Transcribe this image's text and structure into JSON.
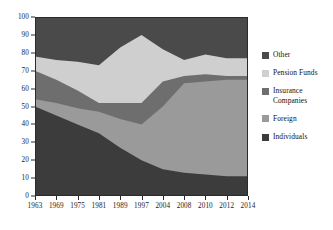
{
  "chart_data": {
    "type": "area",
    "stacked": true,
    "title": "",
    "xlabel": "",
    "ylabel": "",
    "x": [
      1963,
      1969,
      1975,
      1981,
      1989,
      1997,
      2004,
      2008,
      2010,
      2012,
      2014
    ],
    "categories": [
      "1963",
      "1969",
      "1975",
      "1981",
      "1989",
      "1997",
      "2004",
      "2008",
      "2010",
      "2012",
      "2014"
    ],
    "xtick_labels": [
      "1963",
      "1969",
      "1975",
      "1981",
      "1989",
      "1997",
      "2004",
      "2008",
      "2010",
      "2012",
      "2014"
    ],
    "ylim": [
      0,
      100
    ],
    "ytick_labels": [
      "0",
      "10",
      "20",
      "30",
      "40",
      "50",
      "60",
      "70",
      "80",
      "90",
      "100"
    ],
    "yticks": [
      0,
      10,
      20,
      30,
      40,
      50,
      60,
      70,
      80,
      90,
      100
    ],
    "grid": false,
    "legend_position": "right",
    "series": [
      {
        "name": "Individuals",
        "color": "#3c3c3c",
        "values": [
          50,
          45,
          40,
          35,
          27,
          20,
          15,
          13,
          12,
          11,
          11
        ]
      },
      {
        "name": "Foreign",
        "color": "#9a9a9a",
        "values": [
          4,
          7,
          9,
          12,
          16,
          20,
          35,
          50,
          52,
          54,
          54
        ]
      },
      {
        "name": "Insurance Companies",
        "color": "#6e6e6e",
        "values": [
          16,
          13,
          10,
          5,
          9,
          12,
          14,
          4,
          4,
          2,
          2
        ]
      },
      {
        "name": "Pension Funds",
        "color": "#cfcfcf",
        "values": [
          8,
          11,
          16,
          21,
          31,
          38,
          18,
          9,
          11,
          10,
          10
        ]
      },
      {
        "name": "Other",
        "color": "#4a4a4a",
        "values": [
          22,
          24,
          25,
          27,
          17,
          10,
          18,
          24,
          21,
          23,
          23
        ]
      }
    ],
    "cumulative_tops": {
      "Individuals": [
        50,
        45,
        40,
        35,
        27,
        20,
        15,
        13,
        12,
        11,
        11
      ],
      "Foreign": [
        54,
        52,
        49,
        47,
        43,
        40,
        50,
        63,
        64,
        65,
        65
      ],
      "Insurance Companies": [
        70,
        65,
        59,
        52,
        52,
        52,
        64,
        67,
        68,
        67,
        67
      ],
      "Pension Funds": [
        78,
        76,
        75,
        73,
        83,
        90,
        82,
        76,
        79,
        77,
        77
      ],
      "Other": [
        100,
        100,
        100,
        100,
        100,
        100,
        100,
        100,
        100,
        100,
        100
      ]
    }
  },
  "legend": {
    "items": [
      {
        "label": "Other",
        "color": "#4a4a4a"
      },
      {
        "label": "Pension Funds",
        "color": "#cfcfcf"
      },
      {
        "label": "Insurance Companies",
        "color": "#6e6e6e"
      },
      {
        "label": "Foreign",
        "color": "#9a9a9a"
      },
      {
        "label": "Individuals",
        "color": "#3c3c3c"
      }
    ]
  },
  "axes": {
    "frame_color": "#2b2b2b",
    "tick_color": "#2b2b2b",
    "label_color": "#1a1a1a"
  }
}
